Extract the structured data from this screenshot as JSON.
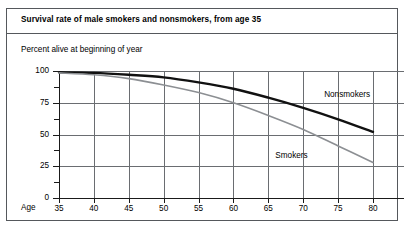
{
  "chart_data": {
    "type": "line",
    "title": "Survival rate of male smokers and nonsmokers, from age 35",
    "ylabel": "Percent alive at beginning of year",
    "xlabel": "Age",
    "xlim": [
      35,
      80
    ],
    "ylim": [
      0,
      100
    ],
    "grid": true,
    "legend_position": "inline-annotation",
    "x_ticks": [
      35,
      40,
      45,
      50,
      55,
      60,
      65,
      70,
      75,
      80
    ],
    "x_tick_labels": [
      "35",
      "40",
      "45",
      "50",
      "55",
      "60",
      "65",
      "70",
      "75",
      "80"
    ],
    "y_ticks": [
      0,
      25,
      50,
      75,
      100
    ],
    "y_tick_labels": [
      "0",
      "25",
      "50",
      "75",
      "100"
    ],
    "y_minor_ticks": [
      12.5,
      37.5,
      62.5,
      87.5
    ],
    "x": [
      35,
      40,
      45,
      50,
      55,
      60,
      65,
      70,
      75,
      80
    ],
    "series": [
      {
        "name": "Nonsmokers",
        "color": "#111111",
        "width": 2.4,
        "values": [
          99,
          98.5,
          97,
          95,
          91,
          86,
          79,
          71,
          62,
          52
        ]
      },
      {
        "name": "Smokers",
        "color": "#8c8f93",
        "width": 1.6,
        "values": [
          98.5,
          97,
          94,
          89,
          83,
          75,
          65,
          54,
          41,
          28
        ]
      }
    ],
    "annotations": [
      {
        "text": "Nonsmokers",
        "x": 73,
        "y": 81
      },
      {
        "text": "Smokers",
        "x": 66,
        "y": 33
      }
    ]
  },
  "colors": {
    "frame": "#55585c",
    "grid": "#6a6d71",
    "axis": "#1a1a1a",
    "nonsmokers": "#111111",
    "smokers": "#8c8f93",
    "background": "#ffffff"
  }
}
